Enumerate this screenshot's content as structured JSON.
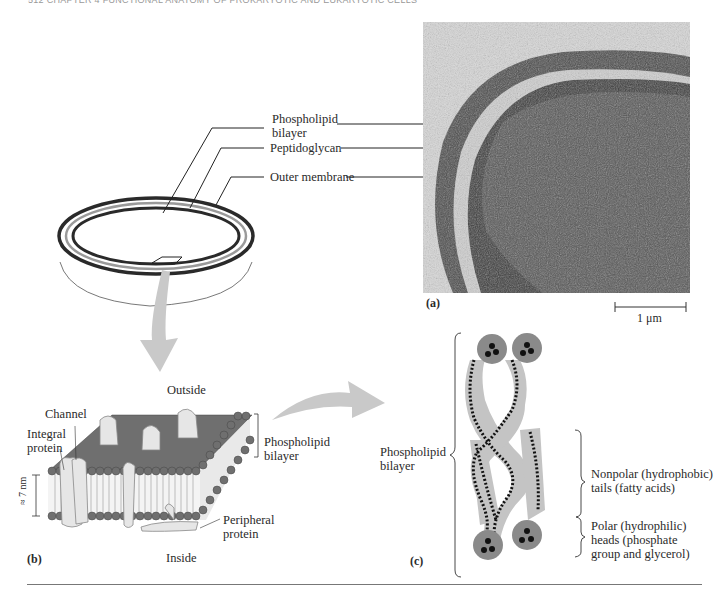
{
  "header": {
    "running_head": "512   CHAPTER 4   FUNCTIONAL ANATOMY OF PROKARYOTIC AND EUKARYOTIC CELLS"
  },
  "panel_a": {
    "tag": "(a)",
    "labels": {
      "phospholipid_1": "Phospholipid",
      "phospholipid_2": "bilayer",
      "peptidoglycan": "Peptidoglycan",
      "outer_membrane": "Outer membrane"
    },
    "scale_bar": "1 μm"
  },
  "panel_b": {
    "tag": "(b)",
    "outside": "Outside",
    "inside": "Inside",
    "channel": "Channel",
    "integral_1": "Integral",
    "integral_2": "protein",
    "thickness": "≈ 7 nm",
    "bilayer_1": "Phospholipid",
    "bilayer_2": "bilayer",
    "peripheral_1": "Peripheral",
    "peripheral_2": "protein"
  },
  "panel_c": {
    "tag": "(c)",
    "bilayer_1": "Phospholipid",
    "bilayer_2": "bilayer",
    "nonpolar_1": "Nonpolar (hydrophobic)",
    "nonpolar_2": "tails (fatty acids)",
    "polar_1": "Polar (hydrophilic)",
    "polar_2": "heads (phosphate",
    "polar_3": "group and glycerol)"
  },
  "colors": {
    "ink": "#222222",
    "arrow": "#c9c9c9",
    "membrane_gray": "#9a9a9a",
    "head_gray": "#8a8a8a"
  }
}
